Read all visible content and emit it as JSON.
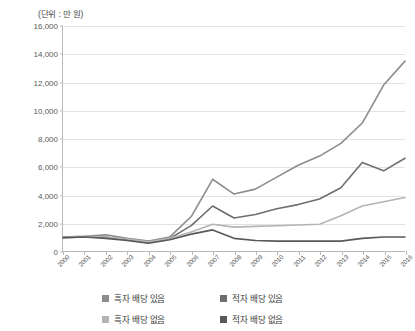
{
  "unit_label": "(단위 : 만 원)",
  "legend": {
    "items": [
      {
        "label": "흑자 배당 있음",
        "color": "#8c8c8c"
      },
      {
        "label": "적자 배당 있음",
        "color": "#6e6e6e"
      },
      {
        "label": "흑자 배당 없음",
        "color": "#b4b4b4"
      },
      {
        "label": "적자 배당 없음",
        "color": "#585858"
      }
    ]
  },
  "chart_data": {
    "type": "line",
    "title": "",
    "subtitle": "",
    "xlabel": "",
    "ylabel": "(단위 : 만 원)",
    "ylim": [
      0,
      16000
    ],
    "ytick_step": 2000,
    "yticks": [
      0,
      2000,
      4000,
      6000,
      8000,
      10000,
      12000,
      14000,
      16000
    ],
    "ytick_labels": [
      "0",
      "2,000",
      "4,000",
      "6,000",
      "8,000",
      "10,000",
      "12,000",
      "14,000",
      "16,000"
    ],
    "grid": true,
    "legend_position": "bottom",
    "categories": [
      "2000",
      "2001",
      "2002",
      "2003",
      "2004",
      "2005",
      "2006",
      "2007",
      "2008",
      "2009",
      "2010",
      "2011",
      "2012",
      "2013",
      "2014",
      "2015",
      "2016"
    ],
    "series": [
      {
        "name": "흑자 배당 있음",
        "color": "#8c8c8c",
        "values": [
          1000,
          1050,
          1150,
          900,
          700,
          1000,
          2450,
          5100,
          4050,
          4400,
          5250,
          6100,
          6750,
          7650,
          9100,
          11800,
          13500
        ]
      },
      {
        "name": "적자 배당 있음",
        "color": "#6e6e6e",
        "values": [
          950,
          1000,
          1000,
          800,
          600,
          900,
          1800,
          3200,
          2350,
          2600,
          3000,
          3300,
          3700,
          4500,
          6300,
          5700,
          6600
        ]
      },
      {
        "name": "흑자 배당 없음",
        "color": "#b4b4b4",
        "values": [
          1000,
          1050,
          1000,
          850,
          650,
          900,
          1350,
          1900,
          1700,
          1750,
          1800,
          1850,
          1900,
          2500,
          3200,
          3500,
          3800
        ]
      },
      {
        "name": "적자 배당 없음",
        "color": "#585858",
        "values": [
          950,
          1000,
          900,
          750,
          550,
          800,
          1200,
          1500,
          900,
          750,
          700,
          700,
          700,
          700,
          900,
          1000,
          1000
        ]
      }
    ]
  }
}
